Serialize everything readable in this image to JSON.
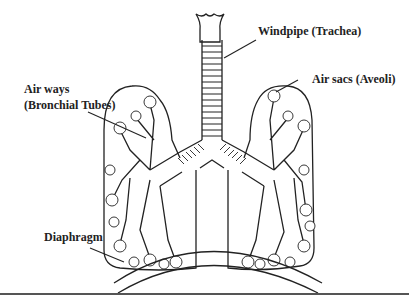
{
  "diagram": {
    "labels": {
      "trachea": "Windpipe (Trachea)",
      "airways_line1": "Air ways",
      "airways_line2": "(Bronchial Tubes)",
      "airsacs": "Air sacs (Aveoli)",
      "diaphragm": "Diaphragm"
    },
    "colors": {
      "ink": "#222222",
      "background": "#ffffff"
    }
  }
}
